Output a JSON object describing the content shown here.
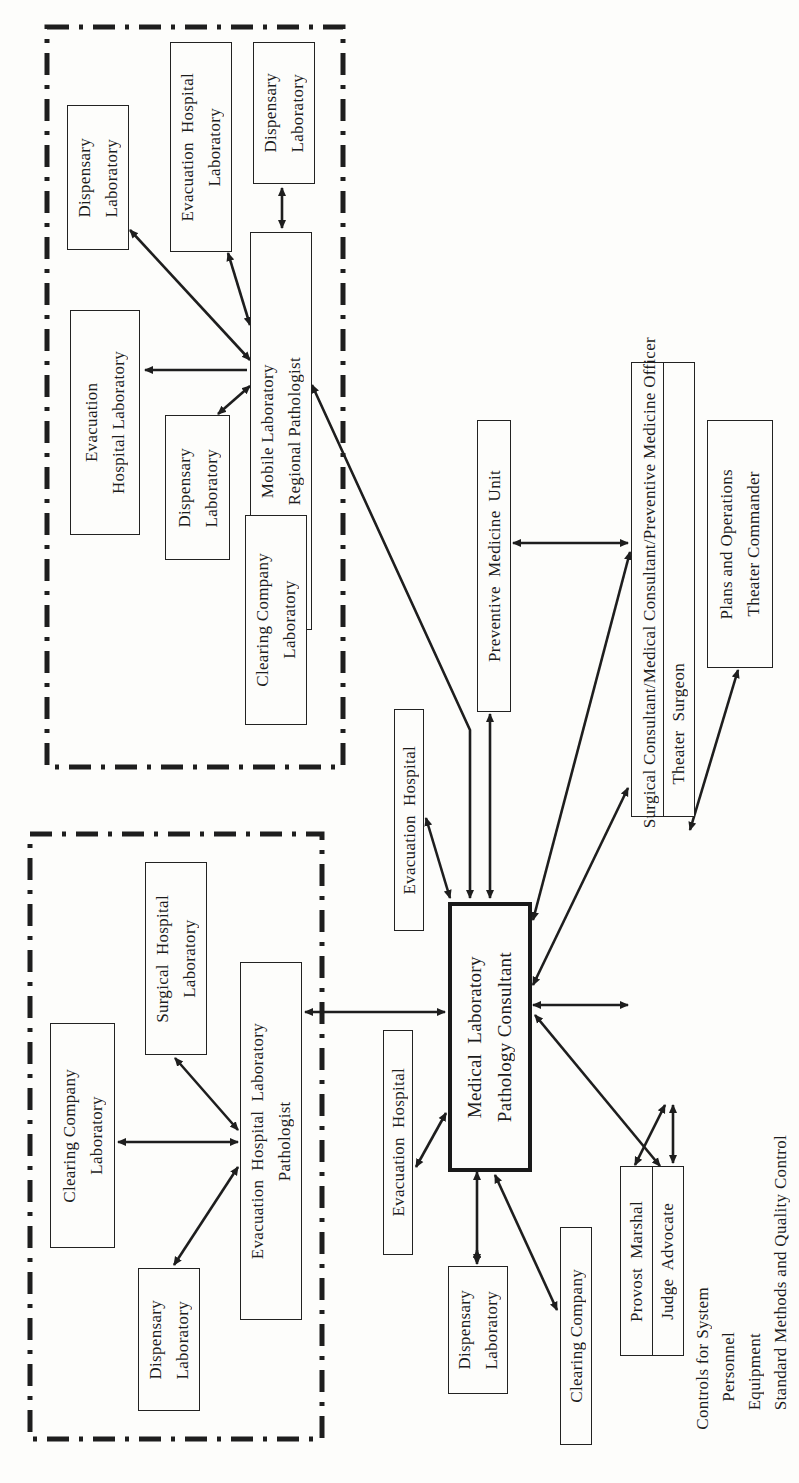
{
  "diagram": {
    "type": "organizational-flow",
    "orientation": "rotated-90-ccw",
    "groups": [
      {
        "id": "forward-region",
        "style": "dash-dot border"
      },
      {
        "id": "rear-region",
        "style": "dash-dot border"
      }
    ],
    "nodes": {
      "top_dispensary_lab_1": "Dispensary\nLaboratory",
      "top_evac_hospital_lab_1": "Evacuation  Hospital\nLaboratory",
      "top_dispensary_lab_2": "Dispensary\nLaboratory",
      "mobile_lab": "Mobile Laboratory\nRegional Pathologist",
      "top_evac_hospital_lab_2": "Evacuation\nHospital Laboratory",
      "top_dispensary_lab_3": "Dispensary\nLaboratory",
      "top_clearing_company_lab": "Clearing Company\nLaboratory",
      "preventive_medicine_unit": "Preventive  Medicine  Unit",
      "surgical_consultant_row1": "Surgical Consultant/Medical Consultant/Preventive Medicine Officer",
      "surgical_consultant_row2": "Theater  Surgeon",
      "plans_operations": "Plans and Operations\nTheater Commander",
      "bottom_surgical_hospital_lab": "Surgical  Hospital\nLaboratory",
      "bottom_clearing_company_lab": "Clearing Company\nLaboratory",
      "bottom_evac_hospital_lab_pathologist": "Evacuation  Hospital  Laboratory\nPathologist",
      "bottom_dispensary_lab": "Dispensary\nLaboratory",
      "evac_hospital_upper": "Evacuation  Hospital",
      "evac_hospital_lower": "Evacuation  Hospital",
      "medical_lab_consultant": "Medical  Laboratory\nPathology Consultant",
      "mid_dispensary_lab": "Dispensary\nLaboratory",
      "clearing_company": "Clearing Company",
      "provost_marshal": "Provost  Marshal",
      "judge_advocate": "Judge  Advocate"
    },
    "controls_note": {
      "title": "Controls for System",
      "items": [
        "Personnel",
        "Equipment",
        "Standard Methods and Quality Control"
      ]
    },
    "edges": [
      [
        "mobile_lab",
        "top_dispensary_lab_1",
        "bidirectional"
      ],
      [
        "mobile_lab",
        "top_evac_hospital_lab_1",
        "bidirectional"
      ],
      [
        "mobile_lab",
        "top_dispensary_lab_2",
        "bidirectional"
      ],
      [
        "mobile_lab",
        "top_evac_hospital_lab_2",
        "to-target"
      ],
      [
        "mobile_lab",
        "top_dispensary_lab_3",
        "bidirectional"
      ],
      [
        "mobile_lab",
        "top_clearing_company_lab",
        "bidirectional"
      ],
      [
        "mobile_lab",
        "medical_lab_consultant",
        "bidirectional"
      ],
      [
        "preventive_medicine_unit",
        "medical_lab_consultant",
        "bidirectional"
      ],
      [
        "preventive_medicine_unit",
        "surgical_consultant",
        "bidirectional"
      ],
      [
        "surgical_consultant",
        "medical_lab_consultant",
        "bidirectional"
      ],
      [
        "plans_operations",
        "surgical_consultant",
        "bidirectional"
      ],
      [
        "evac_hospital_upper",
        "medical_lab_consultant",
        "bidirectional"
      ],
      [
        "evac_hospital_lower",
        "medical_lab_consultant",
        "bidirectional"
      ],
      [
        "bottom_evac_hospital_lab_pathologist",
        "medical_lab_consultant",
        "bidirectional"
      ],
      [
        "bottom_evac_hospital_lab_pathologist",
        "bottom_surgical_hospital_lab",
        "bidirectional"
      ],
      [
        "bottom_evac_hospital_lab_pathologist",
        "bottom_clearing_company_lab",
        "bidirectional"
      ],
      [
        "bottom_evac_hospital_lab_pathologist",
        "bottom_dispensary_lab",
        "bidirectional"
      ],
      [
        "mid_dispensary_lab",
        "medical_lab_consultant",
        "bidirectional"
      ],
      [
        "clearing_company",
        "medical_lab_consultant",
        "bidirectional"
      ],
      [
        "provost_judge",
        "medical_lab_consultant",
        "bidirectional"
      ],
      [
        "provost_judge",
        "surgical_consultant",
        "bidirectional"
      ]
    ]
  }
}
